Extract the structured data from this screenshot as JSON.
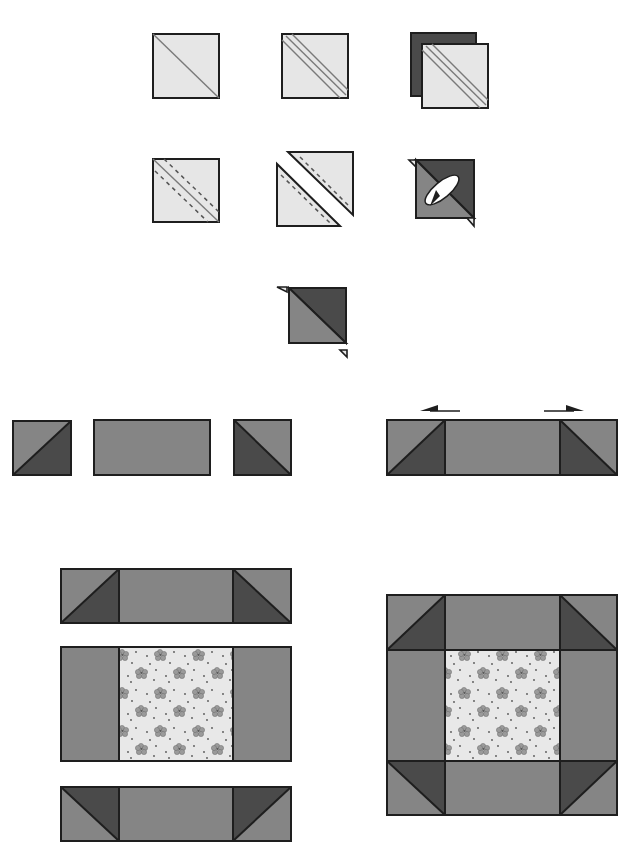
{
  "diagram": {
    "colors": {
      "light": "#e6e6e6",
      "medium": "#858585",
      "dark": "#4a4a4a",
      "outline": "#1e1e1e",
      "print_background": "#e8e8e8",
      "print_motif": "#8a8a8a"
    },
    "steps": [
      {
        "id": 1,
        "description": "Draw diagonal line on light square"
      },
      {
        "id": 2,
        "description": "Draw sewing lines 1/4 inch each side of diagonal"
      },
      {
        "id": 3,
        "description": "Layer light square on dark square"
      },
      {
        "id": 4,
        "description": "Stitch along dashed lines"
      },
      {
        "id": 5,
        "description": "Cut apart on drawn line"
      },
      {
        "id": 6,
        "description": "Press seam toward dark fabric"
      },
      {
        "id": 7,
        "description": "Trim dog ears from half-square triangle"
      },
      {
        "id": 8,
        "description": "Lay out half-square triangle, rectangle, half-square triangle"
      },
      {
        "id": 9,
        "description": "Sew into row; press seams toward rectangle"
      },
      {
        "id": 10,
        "description": "Arrange three rows with printed center square"
      },
      {
        "id": 11,
        "description": "Sew rows together to complete block"
      }
    ],
    "press_arrows": [
      "left",
      "right"
    ]
  }
}
